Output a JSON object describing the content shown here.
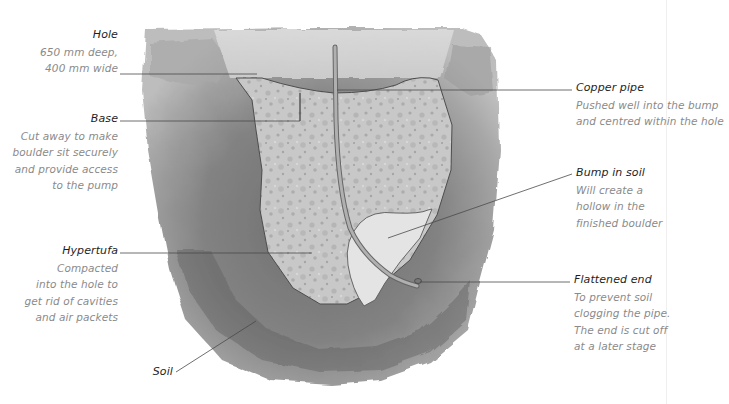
{
  "diagram": {
    "type": "cross-section illustration",
    "colors": {
      "soil": "#8e8e8e",
      "soil_dark": "#6f6f6f",
      "hypertufa": "#c9c9c9",
      "bump": "#e6e6e6",
      "hole_top": "#d4d4d4",
      "pipe": "#9a9a9a",
      "leader_line": "#4a4a4a",
      "label_title": "#1e1e1e",
      "label_body": "#8a8a8a"
    }
  },
  "labels": {
    "hole": {
      "title": "Hole",
      "lines": [
        "650 mm deep,",
        "400 mm wide"
      ]
    },
    "base": {
      "title": "Base",
      "lines": [
        "Cut away to make",
        "boulder sit securely",
        "and provide access",
        "to the pump"
      ]
    },
    "hypertufa": {
      "title": "Hypertufa",
      "lines": [
        "Compacted",
        "into the hole to",
        "get rid of cavities",
        "and air packets"
      ]
    },
    "soil": {
      "title": "Soil",
      "lines": []
    },
    "copper_pipe": {
      "title": "Copper pipe",
      "lines": [
        "Pushed well into the bump",
        "and centred within the hole"
      ]
    },
    "bump_in_soil": {
      "title": "Bump in soil",
      "lines": [
        "Will create a",
        "hollow in the",
        "finished boulder"
      ]
    },
    "flattened_end": {
      "title": "Flattened end",
      "lines": [
        "To prevent soil",
        "clogging the pipe.",
        "The end is cut off",
        "at a later stage"
      ]
    }
  }
}
